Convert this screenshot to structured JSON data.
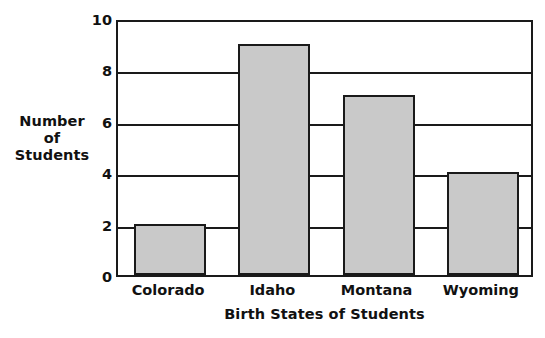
{
  "chart_data": {
    "type": "bar",
    "title": "",
    "xlabel": "Birth States of Students",
    "ylabel": "Number of Students",
    "ylabel_lines": [
      "Number",
      "of",
      "Students"
    ],
    "categories": [
      "Colorado",
      "Idaho",
      "Montana",
      "Wyoming"
    ],
    "values": [
      2,
      9,
      7,
      4
    ],
    "ylim": [
      0,
      10
    ],
    "yticks": [
      0,
      2,
      4,
      6,
      8,
      10
    ],
    "ytick_labels": [
      "0",
      "2",
      "4",
      "6",
      "8",
      "10"
    ],
    "grid": "horizontal",
    "legend": "none",
    "bar_fill_color": "#c9c9c9",
    "bar_edge_color": "#1a1a1a",
    "background_color": "#ffffff",
    "axis_color": "#1a1a1a"
  }
}
